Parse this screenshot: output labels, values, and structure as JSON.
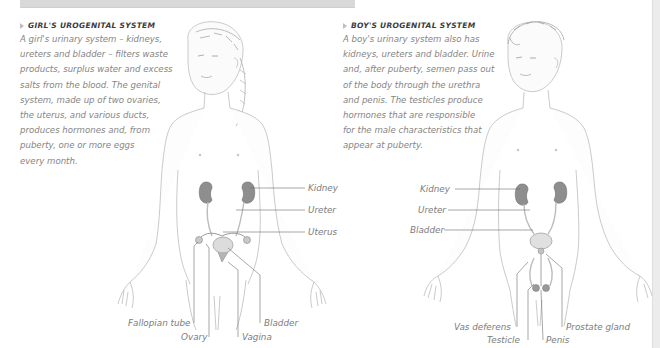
{
  "page": {
    "colors": {
      "background": "#ffffff",
      "top_band": "#d9d9d9",
      "heading_text": "#3c3c3c",
      "body_text": "#858585",
      "label_text": "#7c7c7c",
      "organ_kidney": "#8c8c8c",
      "outline": "#b5b5b5"
    }
  },
  "girl": {
    "heading": "Girl's urogenital system",
    "paragraph_lines": [
      "A girl's urinary system – kidneys,",
      "ureters and bladder – filters waste",
      "products, surplus water and excess",
      "salts from the blood. The genital",
      "system, made up of two ovaries,",
      "the uterus, and various ducts,",
      "produces hormones and, from",
      "puberty, one or more eggs",
      "every month."
    ],
    "labels": {
      "kidney": "Kidney",
      "ureter": "Ureter",
      "uterus": "Uterus",
      "fallopian_tube": "Fallopian tube",
      "ovary": "Ovary",
      "bladder": "Bladder",
      "vagina": "Vagina"
    }
  },
  "boy": {
    "heading": "Boy's urogenital system",
    "paragraph_lines": [
      "A boy's urinary system also has",
      "kidneys, ureters and bladder. Urine",
      "and, after puberty, semen pass out",
      "of the body through the urethra",
      "and penis. The testicles produce",
      "hormones that are responsible",
      "for the male characteristics that",
      "appear at puberty."
    ],
    "labels": {
      "kidney": "Kidney",
      "ureter": "Ureter",
      "bladder": "Bladder",
      "vas_deferens": "Vas deferens",
      "testicle": "Testicle",
      "penis": "Penis",
      "prostate_gland": "Prostate gland"
    }
  }
}
